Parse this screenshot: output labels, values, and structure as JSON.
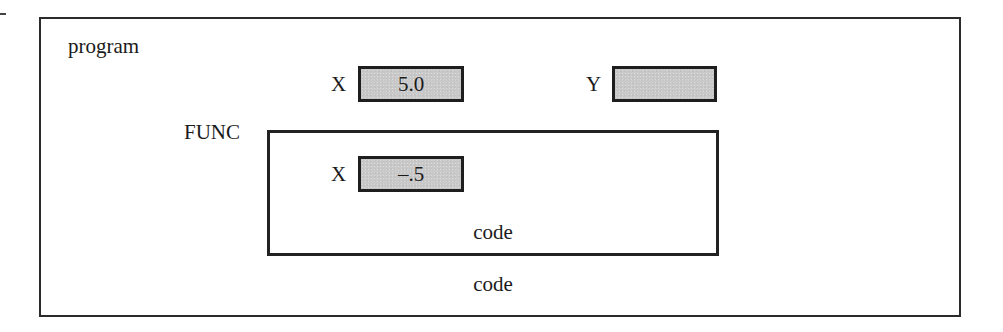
{
  "diagram": {
    "outer_scope": {
      "label": "program",
      "variables": [
        {
          "name": "X",
          "value": "5.0"
        },
        {
          "name": "Y",
          "value": ""
        }
      ],
      "code_label": "code"
    },
    "inner_scope": {
      "label": "FUNC",
      "variables": [
        {
          "name": "X",
          "value": "–.5"
        }
      ],
      "code_label": "code"
    },
    "colors": {
      "border": "#222222",
      "variable_fill": "#c9c9c9",
      "background": "#ffffff",
      "text": "#1a1a1a"
    }
  }
}
